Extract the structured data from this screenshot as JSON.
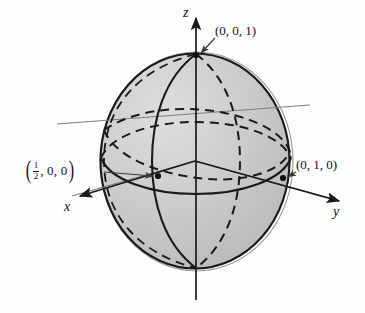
{
  "figure": {
    "type": "3d-sphere-coordinate-diagram",
    "background_color": "#fefefe",
    "sphere": {
      "fill_color": "#c9c9c9",
      "outline_color": "#1a1a1a",
      "center_px": [
        195,
        161
      ],
      "radius_x_px": 95,
      "radius_y_px": 108
    },
    "line_colors": {
      "curve": "#1a1a1a",
      "axis": "#1a1a1a",
      "guide": "#7d7d7d"
    },
    "axes": [
      {
        "name": "z-axis",
        "label": "z",
        "label_x": 183,
        "label_y": 6,
        "direction": "up"
      },
      {
        "name": "y-axis",
        "label": "y",
        "label_x": 333,
        "label_y": 205,
        "direction": "lower-right"
      },
      {
        "name": "x-axis",
        "label": "x",
        "label_x": 64,
        "label_y": 200,
        "direction": "lower-left"
      }
    ],
    "points": [
      {
        "name": "north-pole-point",
        "label": "(0, 0, 1)",
        "label_x": 215,
        "label_y": 30,
        "marker_x": 196,
        "marker_y": 55,
        "has_leader_arrow": true
      },
      {
        "name": "y-intercept-point",
        "label": "(0, 1, 0)",
        "label_x": 296,
        "label_y": 163,
        "marker_x": 283,
        "marker_y": 178,
        "has_leader_arrow": true
      },
      {
        "name": "x-intercept-point",
        "label_parts": {
          "numerator": "1",
          "denominator": "2",
          "rest": ", 0, 0"
        },
        "label_x": 24,
        "label_y": 163,
        "marker_x": 158,
        "marker_y": 176,
        "has_leader_arrow": true
      }
    ],
    "curves": [
      {
        "name": "sphere-outline",
        "style": "solid"
      },
      {
        "name": "meridian-front",
        "style": "solid"
      },
      {
        "name": "meridian-back",
        "style": "dashed"
      },
      {
        "name": "equator-front",
        "style": "solid"
      },
      {
        "name": "equator-back",
        "style": "dashed"
      },
      {
        "name": "tilted-great-circle",
        "style": "dashed"
      }
    ]
  }
}
